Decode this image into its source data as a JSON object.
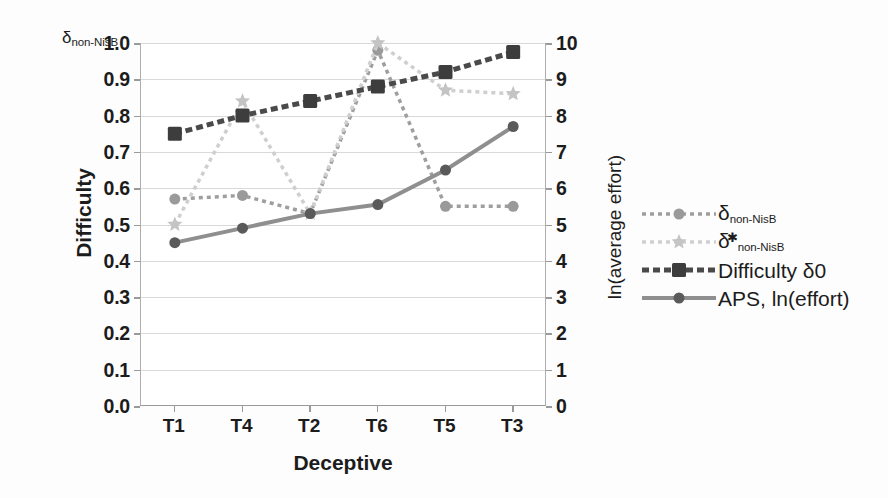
{
  "corner_label": {
    "symbol": "δ",
    "subscript": "non-NisB"
  },
  "axes": {
    "left_title": "Difficulty",
    "right_title": "ln(average effort)",
    "x_title": "Deceptive",
    "left_ticks": [
      "0.0",
      "0.1",
      "0.2",
      "0.3",
      "0.4",
      "0.5",
      "0.6",
      "0.7",
      "0.8",
      "0.9",
      "1.0"
    ],
    "right_ticks": [
      "0",
      "1",
      "2",
      "3",
      "4",
      "5",
      "6",
      "7",
      "8",
      "9",
      "10"
    ],
    "x_ticks": [
      "T1",
      "T4",
      "T2",
      "T6",
      "T5",
      "T3"
    ]
  },
  "legend": {
    "items": [
      {
        "label_symbol": "δ",
        "label_sub": "non-NisB",
        "label_star": "",
        "marker": "circle",
        "line": "dotted",
        "color": "#9e9e9e"
      },
      {
        "label_symbol": "δ",
        "label_sub": "non-NisB",
        "label_star": "✱",
        "marker": "star",
        "line": "dotted",
        "color": "#cfcfcf"
      },
      {
        "label_symbol": "Difficulty δ0",
        "label_sub": "",
        "label_star": "",
        "marker": "square",
        "line": "dashed",
        "color": "#4a4a4a"
      },
      {
        "label_symbol": "APS, ln(effort)",
        "label_sub": "",
        "label_star": "",
        "marker": "circle",
        "line": "solid",
        "color": "#8f8f8f"
      }
    ]
  },
  "chart_data": {
    "type": "line",
    "title": "",
    "xlabel": "Deceptive",
    "ylabel": "Difficulty",
    "y2label": "ln(average effort)",
    "categories": [
      "T1",
      "T4",
      "T2",
      "T6",
      "T5",
      "T3"
    ],
    "ylim": [
      0.0,
      1.0
    ],
    "y2lim": [
      0,
      10
    ],
    "grid": true,
    "legend_position": "right",
    "series": [
      {
        "name": "δ non-NisB",
        "axis": "left",
        "marker": "circle",
        "linestyle": "dotted",
        "color": "#9e9e9e",
        "values": [
          0.57,
          0.58,
          0.53,
          0.98,
          0.55,
          0.55
        ]
      },
      {
        "name": "δ* non-NisB",
        "axis": "left",
        "marker": "star",
        "linestyle": "dotted",
        "color": "#cfcfcf",
        "values": [
          0.5,
          0.84,
          0.53,
          1.0,
          0.87,
          0.86
        ]
      },
      {
        "name": "Difficulty δ0",
        "axis": "left",
        "marker": "square",
        "linestyle": "dashed",
        "color": "#4a4a4a",
        "values": [
          0.75,
          0.8,
          0.84,
          0.88,
          0.92,
          0.975
        ]
      },
      {
        "name": "APS, ln(effort)",
        "axis": "left",
        "marker": "circle",
        "linestyle": "solid",
        "color": "#8f8f8f",
        "values": [
          0.45,
          0.49,
          0.53,
          0.555,
          0.65,
          0.77
        ]
      }
    ]
  }
}
